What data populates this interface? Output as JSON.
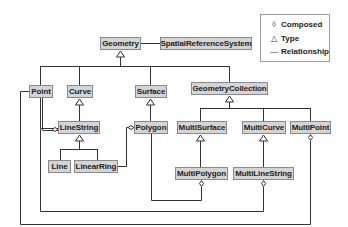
{
  "diagram": {
    "nodes": {
      "geometry": "Geometry",
      "spatial_reference_system": "SpatialReferenceSystem",
      "point": "Point",
      "curve": "Curve",
      "surface": "Surface",
      "geometry_collection": "GeometryCollection",
      "line_string": "LineString",
      "polygon": "Polygon",
      "multi_surface": "MultiSurface",
      "multi_curve": "MultiCurve",
      "multi_point": "MultiPoint",
      "line": "Line",
      "linear_ring": "LinearRing",
      "multi_polygon": "MultiPolygon",
      "multi_line_string": "MultiLineString"
    },
    "legend": {
      "items": [
        {
          "symbol": "diamond-icon",
          "glyph": "◊",
          "label": "Composed"
        },
        {
          "symbol": "triangle-icon",
          "glyph": "△",
          "label": "Type"
        },
        {
          "symbol": "line-icon",
          "glyph": "—",
          "label": "Relationship"
        }
      ]
    },
    "colors": {
      "node_fill": "#d4d4d4",
      "node_border": "#8a8a8a",
      "line": "#333333"
    }
  }
}
